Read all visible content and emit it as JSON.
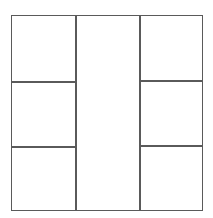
{
  "diagram": {
    "type": "grid-layout",
    "stroke_color": "#5a5a5a",
    "background_color": "#ffffff",
    "columns": [
      {
        "name": "left",
        "cells": 3
      },
      {
        "name": "center",
        "cells": 1
      },
      {
        "name": "right",
        "cells": 3
      }
    ],
    "cells": [
      {
        "id": "left-top",
        "label": ""
      },
      {
        "id": "left-middle",
        "label": ""
      },
      {
        "id": "left-bottom",
        "label": ""
      },
      {
        "id": "center",
        "label": ""
      },
      {
        "id": "right-top",
        "label": ""
      },
      {
        "id": "right-middle",
        "label": ""
      },
      {
        "id": "right-bottom",
        "label": ""
      }
    ]
  }
}
